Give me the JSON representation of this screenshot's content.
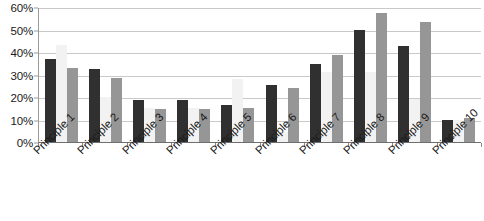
{
  "chart_data": {
    "type": "bar",
    "title": "",
    "subtitle": "",
    "xlabel": "",
    "ylabel": "",
    "ylim": [
      0,
      60
    ],
    "ytick_labels": [
      "0%",
      "10%",
      "20%",
      "30%",
      "40%",
      "50%",
      "60%"
    ],
    "ytick_values": [
      0,
      10,
      20,
      30,
      40,
      50,
      60
    ],
    "grid": true,
    "legend": "none",
    "categories": [
      "Principle 1",
      "Principle 2",
      "Principle 3",
      "Principle 4",
      "Principle 5",
      "Principle 6",
      "Principle 7",
      "Principle 8",
      "Principle 9",
      "Principle 10"
    ],
    "series": [
      {
        "name": "Series 1",
        "color": "#303030",
        "values": [
          37,
          32.5,
          18.5,
          18.5,
          16.5,
          25.5,
          34.5,
          50,
          42.5,
          10
        ]
      },
      {
        "name": "Series 2",
        "color": "#f2f2f2",
        "values": [
          43,
          20,
          15,
          15,
          28,
          4.5,
          31,
          31,
          19,
          10
        ]
      },
      {
        "name": "Series 3",
        "color": "#969696",
        "values": [
          33,
          28.5,
          14.5,
          14.5,
          15,
          24,
          38.5,
          57.5,
          53.5,
          10.5
        ]
      }
    ]
  },
  "colors": {
    "series_1": "#303030",
    "series_2": "#f2f2f2",
    "series_3": "#969696",
    "gridline": "#c9c9c9",
    "axis": "#6e6e6e",
    "text": "#1a1a1a",
    "background": "#ffffff"
  }
}
